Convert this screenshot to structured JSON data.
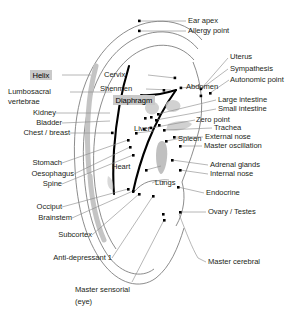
{
  "figure": {
    "type": "anatomical-diagram",
    "colors": {
      "background": "#ffffff",
      "outline": "#6f6f6f",
      "antihelix_stroke": "#000000",
      "leader_line": "#8a8a8a",
      "point_marker": "#000000",
      "helix_band": "#c4c4c4",
      "shading": "#c9c9c9",
      "highlight_box": "#c9c9c9",
      "text": "#231f20"
    }
  },
  "labels": {
    "left": [
      {
        "id": "helix",
        "text": "Helix",
        "highlight": true
      },
      {
        "id": "lumbosacral",
        "text": "Lumbosacral",
        "highlight": false
      },
      {
        "id": "vertebrae",
        "text": "vertebrae",
        "highlight": false
      },
      {
        "id": "kidney",
        "text": "Kidney",
        "highlight": false
      },
      {
        "id": "bladder",
        "text": "Bladder",
        "highlight": false
      },
      {
        "id": "chest-breast",
        "text": "Chest / breast",
        "highlight": false
      },
      {
        "id": "stomach",
        "text": "Stomach",
        "highlight": false
      },
      {
        "id": "oesophagus",
        "text": "Oesophagus",
        "highlight": false
      },
      {
        "id": "spine",
        "text": "Spine",
        "highlight": false
      },
      {
        "id": "occiput",
        "text": "Occiput",
        "highlight": false
      },
      {
        "id": "brainstem",
        "text": "Brainstem",
        "highlight": false
      },
      {
        "id": "subcortex",
        "text": "Subcortex",
        "highlight": false
      },
      {
        "id": "anti-depressant-1",
        "text": "Anti-depressant 1",
        "highlight": false
      }
    ],
    "inner": [
      {
        "id": "cervix",
        "text": "Cervix",
        "highlight": false
      },
      {
        "id": "shenmen",
        "text": "Shenmen",
        "highlight": false
      },
      {
        "id": "diaphragm",
        "text": "Diaphragm",
        "highlight": true
      },
      {
        "id": "liver",
        "text": "Liver",
        "highlight": false
      },
      {
        "id": "heart",
        "text": "Heart",
        "highlight": false
      },
      {
        "id": "lungs",
        "text": "Lungs",
        "highlight": false
      },
      {
        "id": "spleen",
        "text": "Spleen",
        "highlight": false
      },
      {
        "id": "abdomen",
        "text": "Abdomen",
        "highlight": false
      }
    ],
    "right": [
      {
        "id": "ear-apex",
        "text": "Ear apex"
      },
      {
        "id": "allergy-point",
        "text": "Allergy point"
      },
      {
        "id": "uterus",
        "text": "Uterus"
      },
      {
        "id": "sympathesis",
        "text": "Sympathesis"
      },
      {
        "id": "autonomic-point",
        "text": "Autonomic point"
      },
      {
        "id": "large-intestine",
        "text": "Large intestine"
      },
      {
        "id": "small-intestine",
        "text": "Small intestine"
      },
      {
        "id": "zero-point",
        "text": "Zero point"
      },
      {
        "id": "trachea",
        "text": "Trachea"
      },
      {
        "id": "external-nose",
        "text": "External nose"
      },
      {
        "id": "master-oscillation",
        "text": "Master oscillation"
      },
      {
        "id": "adrenal-glands",
        "text": "Adrenal glands"
      },
      {
        "id": "internal-nose",
        "text": "Internal nose"
      },
      {
        "id": "endocrine",
        "text": "Endocrine"
      },
      {
        "id": "ovary-testes",
        "text": "Ovary / Testes"
      },
      {
        "id": "master-cerebral",
        "text": "Master cerebral"
      }
    ],
    "bottom": [
      {
        "id": "master-sensorial",
        "text": "Master sensorial"
      },
      {
        "id": "master-sensorial-eye",
        "text": "(eye)"
      }
    ]
  }
}
